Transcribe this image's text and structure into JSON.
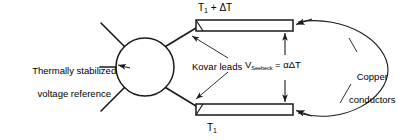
{
  "figure": {
    "type": "schematic-diagram",
    "background_color": "#ffffff",
    "line_color": "#1a1a1a"
  },
  "labels": {
    "reference_line1": "Thermally stabilized",
    "reference_line2": "voltage reference",
    "kovar_leads": "Kovar leads",
    "temp_top_base": "T",
    "temp_top_sub": "1",
    "temp_top_rest": " + ΔT",
    "temp_bottom_base": "T",
    "temp_bottom_sub": "1",
    "seebeck_symbol": "V",
    "seebeck_subscript": "Seebeck",
    "seebeck_equation": " = αΔT",
    "copper_line1": "Copper",
    "copper_line2": "conductors"
  },
  "geometry": {
    "circle_center_x": 145,
    "circle_center_y": 67,
    "circle_radius": 29,
    "top_terminal_y": 25,
    "bottom_terminal_y": 110,
    "terminal_right_x": 293,
    "seebeck_arrow_x": 285
  }
}
